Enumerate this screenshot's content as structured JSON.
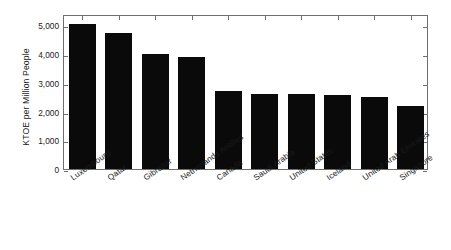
{
  "chart_data": {
    "type": "bar",
    "title": "",
    "subtitle": "",
    "xlabel": "",
    "ylabel": "KTOE per Million People",
    "categories": [
      "Luxembourg",
      "Qatar",
      "Gibraltar",
      "Netherlands Antilles",
      "Canada",
      "Saudi Arabia",
      "United States",
      "Iceland",
      "United Arab Emirates",
      "Singapore"
    ],
    "values": [
      5050,
      4730,
      4010,
      3900,
      2710,
      2630,
      2630,
      2570,
      2500,
      2180
    ],
    "ylim": [
      0,
      5400
    ],
    "yticks": [
      0,
      1000,
      2000,
      3000,
      4000,
      5000
    ],
    "ytick_labels": [
      "0",
      "1,000",
      "2,000",
      "3,000",
      "4,000",
      "5,000"
    ],
    "grid": false,
    "legend": null,
    "bar_color": "#0a0a0a",
    "axis_color": "#6f6f6f",
    "text_color": "#1a1a1a"
  }
}
